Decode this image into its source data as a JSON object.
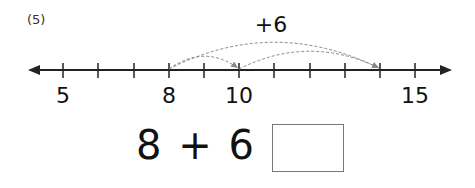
{
  "problem": {
    "number_label": "(5)",
    "jump_label": "+6",
    "equation": "8 + 6 =",
    "answer": ""
  },
  "number_line": {
    "min": 4,
    "max": 16,
    "tick_start": 5,
    "tick_end": 15,
    "labels": [
      {
        "value": 5,
        "text": "5"
      },
      {
        "value": 8,
        "text": "8"
      },
      {
        "value": 10,
        "text": "10"
      },
      {
        "value": 15,
        "text": "15"
      }
    ],
    "jumps": [
      {
        "from": 8,
        "to": 10
      },
      {
        "from": 8,
        "to": 14
      },
      {
        "from": 10,
        "to": 14
      }
    ]
  },
  "colors": {
    "axis": "#222222",
    "arc": "#888888"
  }
}
